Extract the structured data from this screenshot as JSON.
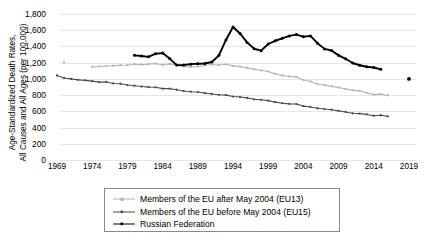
{
  "chart_data": {
    "type": "line",
    "title": "",
    "xlabel": "",
    "ylabel": "Age-Standardized Death Rates, All Causes and All Ages  (per 100,000)",
    "ylabel_line1": "Age-Standardized Death Rates,",
    "ylabel_line2": "All Causes and All Ages  (per 100,000)",
    "xlim": [
      1968,
      2020
    ],
    "ylim": [
      0,
      1800
    ],
    "grid": true,
    "legend_position": "bottom",
    "yticks": [
      "0",
      "200",
      "400",
      "600",
      "800",
      "1,000",
      "1,200",
      "1,400",
      "1,600",
      "1,800"
    ],
    "ytick_values": [
      0,
      200,
      400,
      600,
      800,
      1000,
      1200,
      1400,
      1600,
      1800
    ],
    "xticks": [
      "1969",
      "1974",
      "1979",
      "1984",
      "1989",
      "1994",
      "1999",
      "2004",
      "2009",
      "2014",
      "2019"
    ],
    "xtick_values": [
      1969,
      1974,
      1979,
      1984,
      1989,
      1994,
      1999,
      2004,
      2009,
      2014,
      2019
    ],
    "series": [
      {
        "name": "Members of the EU after May 2004 (EU13)",
        "color": "#b3b3b3",
        "x": [
          1970,
          1974,
          1975,
          1976,
          1977,
          1978,
          1979,
          1980,
          1981,
          1982,
          1983,
          1984,
          1985,
          1986,
          1987,
          1988,
          1989,
          1990,
          1991,
          1992,
          1993,
          1994,
          1995,
          1996,
          1997,
          1998,
          1999,
          2000,
          2001,
          2002,
          2003,
          2004,
          2005,
          2006,
          2007,
          2008,
          2009,
          2010,
          2011,
          2012,
          2013,
          2014,
          2015,
          2016
        ],
        "values": [
          1202,
          1148,
          1152,
          1158,
          1162,
          1168,
          1172,
          1180,
          1175,
          1182,
          1190,
          1172,
          1185,
          1168,
          1150,
          1148,
          1152,
          1165,
          1178,
          1172,
          1180,
          1160,
          1152,
          1136,
          1120,
          1104,
          1092,
          1062,
          1042,
          1030,
          1024,
          986,
          968,
          936,
          922,
          908,
          894,
          876,
          860,
          852,
          828,
          806,
          812,
          796
        ]
      },
      {
        "name": "Members of the EU before May 2004 (EU15)",
        "color": "#4d4d4d",
        "x": [
          1969,
          1970,
          1971,
          1972,
          1973,
          1974,
          1975,
          1976,
          1977,
          1978,
          1979,
          1980,
          1981,
          1982,
          1983,
          1984,
          1985,
          1986,
          1987,
          1988,
          1989,
          1990,
          1991,
          1992,
          1993,
          1994,
          1995,
          1996,
          1997,
          1998,
          1999,
          2000,
          2001,
          2002,
          2003,
          2004,
          2005,
          2006,
          2007,
          2008,
          2009,
          2010,
          2011,
          2012,
          2013,
          2014,
          2015,
          2016
        ],
        "values": [
          1042,
          1012,
          1000,
          988,
          982,
          972,
          960,
          962,
          944,
          940,
          924,
          916,
          906,
          898,
          896,
          880,
          880,
          866,
          850,
          842,
          838,
          824,
          814,
          804,
          800,
          782,
          776,
          766,
          748,
          742,
          732,
          714,
          700,
          692,
          690,
          664,
          654,
          638,
          628,
          620,
          606,
          592,
          576,
          572,
          562,
          546,
          552,
          538
        ]
      },
      {
        "name": "Russian Federation",
        "color": "#000000",
        "x": [
          1980,
          1981,
          1982,
          1983,
          1984,
          1985,
          1986,
          1987,
          1988,
          1989,
          1990,
          1991,
          1992,
          1993,
          1994,
          1995,
          1996,
          1997,
          1998,
          1999,
          2000,
          2001,
          2002,
          2003,
          2004,
          2005,
          2006,
          2007,
          2008,
          2009,
          2010,
          2011,
          2012,
          2013,
          2014,
          2015
        ],
        "values": [
          1290,
          1282,
          1272,
          1310,
          1318,
          1250,
          1170,
          1172,
          1182,
          1186,
          1190,
          1208,
          1290,
          1480,
          1640,
          1560,
          1450,
          1372,
          1348,
          1430,
          1470,
          1500,
          1530,
          1546,
          1520,
          1530,
          1440,
          1370,
          1350,
          1290,
          1248,
          1196,
          1168,
          1150,
          1140,
          1118
        ]
      }
    ],
    "isolated_points": [
      {
        "series": "Russian Federation",
        "x": 2019,
        "y": 1000,
        "color": "#000000"
      }
    ]
  },
  "legend": {
    "items": [
      {
        "label": "Members of the EU after May 2004 (EU13)",
        "color": "#b3b3b3"
      },
      {
        "label": "Members of the EU before May 2004 (EU15)",
        "color": "#4d4d4d"
      },
      {
        "label": "Russian Federation",
        "color": "#000000"
      }
    ]
  }
}
